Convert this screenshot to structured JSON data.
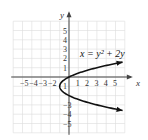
{
  "chart_data": {
    "type": "line",
    "title": "",
    "equation_label": "x = y² + 2y",
    "xlabel": "x",
    "ylabel": "y",
    "xlim": [
      -6,
      6
    ],
    "ylim": [
      -6,
      6
    ],
    "grid": true,
    "x_tick_labels": [
      "-5",
      "-4",
      "-3",
      "-2",
      "1",
      "2",
      "3",
      "4",
      "5"
    ],
    "y_tick_labels": [
      "5",
      "4",
      "3",
      "2",
      "1",
      "1",
      "-3",
      "-4",
      "-5"
    ],
    "series": [
      {
        "name": "x = y² + 2y",
        "color": "#111111",
        "points": [
          {
            "x": 5.6,
            "y": 1.6
          },
          {
            "x": 3,
            "y": 1
          },
          {
            "x": 0,
            "y": 0
          },
          {
            "x": -1,
            "y": -1
          },
          {
            "x": 0,
            "y": -2
          },
          {
            "x": 3,
            "y": -3
          },
          {
            "x": 5.6,
            "y": -3.6
          }
        ]
      }
    ]
  },
  "labels": {
    "x_axis": "x",
    "y_axis": "y",
    "equation": "x = y² + 2y"
  }
}
